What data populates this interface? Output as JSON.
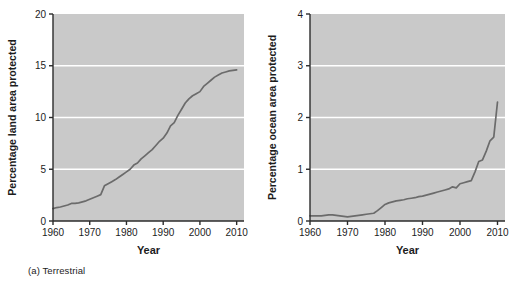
{
  "figure": {
    "background_color": "#ffffff",
    "plot_background_color": "#c9c9c9",
    "gridline_color": "#ffffff",
    "line_color": "#6b6b6b",
    "axis_color": "#2b2b2b",
    "text_color": "#1c1c1c"
  },
  "panels": [
    {
      "id": "a",
      "caption": "(a) Terrestrial",
      "chart_data": {
        "type": "line",
        "title": "",
        "xlabel": "Year",
        "ylabel": "Percentage land area protected",
        "xlim": [
          1960,
          2012
        ],
        "ylim": [
          0,
          20
        ],
        "xticks": [
          1960,
          1970,
          1980,
          1990,
          2000,
          2010
        ],
        "xticklabels": [
          "1960",
          "1970",
          "1980",
          "1990",
          "2000",
          "2010"
        ],
        "yticks": [
          0,
          5,
          10,
          15,
          20
        ],
        "yticklabels": [
          "0",
          "5",
          "10",
          "15",
          "20"
        ],
        "grid": "horizontal",
        "gridlines_at": [
          5,
          10,
          15
        ],
        "legend": "none",
        "series": [
          {
            "name": "Percentage land area protected",
            "x": [
              1960,
              1961,
              1962,
              1963,
              1964,
              1965,
              1966,
              1967,
              1968,
              1969,
              1970,
              1971,
              1972,
              1973,
              1974,
              1975,
              1976,
              1977,
              1978,
              1979,
              1980,
              1981,
              1982,
              1983,
              1984,
              1985,
              1986,
              1987,
              1988,
              1989,
              1990,
              1991,
              1992,
              1993,
              1994,
              1995,
              1996,
              1997,
              1998,
              1999,
              2000,
              2001,
              2002,
              2003,
              2004,
              2005,
              2006,
              2007,
              2008,
              2009,
              2010
            ],
            "values": [
              1.2,
              1.3,
              1.35,
              1.45,
              1.55,
              1.7,
              1.7,
              1.75,
              1.85,
              1.95,
              2.1,
              2.25,
              2.4,
              2.55,
              3.4,
              3.6,
              3.8,
              4.0,
              4.25,
              4.5,
              4.75,
              5.0,
              5.4,
              5.6,
              6.0,
              6.3,
              6.6,
              6.9,
              7.3,
              7.7,
              8.0,
              8.5,
              9.2,
              9.5,
              10.2,
              10.8,
              11.4,
              11.8,
              12.1,
              12.3,
              12.5,
              13.0,
              13.3,
              13.6,
              13.9,
              14.1,
              14.3,
              14.4,
              14.5,
              14.55,
              14.6
            ]
          }
        ]
      }
    },
    {
      "id": "b",
      "caption": "(b)  Marine",
      "chart_data": {
        "type": "line",
        "title": "",
        "xlabel": "Year",
        "ylabel": "Percentage ocean area protected",
        "xlim": [
          1960,
          2012
        ],
        "ylim": [
          0,
          4
        ],
        "xticks": [
          1960,
          1970,
          1980,
          1990,
          2000,
          2010
        ],
        "xticklabels": [
          "1960",
          "1970",
          "1980",
          "1990",
          "2000",
          "2010"
        ],
        "yticks": [
          0,
          1,
          2,
          3,
          4
        ],
        "yticklabels": [
          "0",
          "1",
          "2",
          "3",
          "4"
        ],
        "grid": "horizontal",
        "gridlines_at": [
          1,
          2,
          3
        ],
        "legend": "none",
        "series": [
          {
            "name": "Percentage ocean area protected",
            "x": [
              1960,
              1961,
              1962,
              1963,
              1964,
              1965,
              1966,
              1967,
              1968,
              1969,
              1970,
              1971,
              1972,
              1973,
              1974,
              1975,
              1976,
              1977,
              1978,
              1979,
              1980,
              1981,
              1982,
              1983,
              1984,
              1985,
              1986,
              1987,
              1988,
              1989,
              1990,
              1991,
              1992,
              1993,
              1994,
              1995,
              1996,
              1997,
              1998,
              1999,
              2000,
              2001,
              2002,
              2003,
              2004,
              2005,
              2006,
              2007,
              2008,
              2009,
              2010
            ],
            "values": [
              0.1,
              0.1,
              0.1,
              0.1,
              0.11,
              0.12,
              0.12,
              0.11,
              0.1,
              0.09,
              0.08,
              0.09,
              0.1,
              0.11,
              0.12,
              0.13,
              0.14,
              0.15,
              0.2,
              0.26,
              0.32,
              0.35,
              0.37,
              0.39,
              0.4,
              0.41,
              0.43,
              0.44,
              0.45,
              0.47,
              0.48,
              0.5,
              0.52,
              0.54,
              0.56,
              0.58,
              0.6,
              0.62,
              0.66,
              0.64,
              0.72,
              0.74,
              0.76,
              0.78,
              0.95,
              1.15,
              1.18,
              1.35,
              1.55,
              1.62,
              2.3
            ]
          }
        ]
      }
    }
  ]
}
